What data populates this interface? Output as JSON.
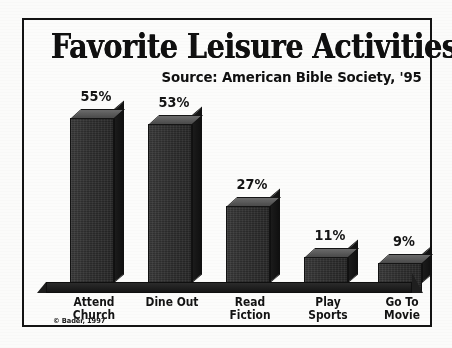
{
  "figure": {
    "title": "Favorite Leisure Activities",
    "subtitle": "Source: American Bible Society, '95",
    "copyright": "© Bader, 1997",
    "frame_color": "#131313",
    "background_color": "#fcfcfb",
    "bar_face_color": "#2f2f2f",
    "bar_top_color": "#5a5a5a",
    "bar_side_color": "#151515",
    "ground_color": "#1c1c1c",
    "text_color": "#131313"
  },
  "chart_data": {
    "type": "bar",
    "title": "Favorite Leisure Activities",
    "subtitle": "Source: American Bible Society, '95",
    "xlabel": "",
    "ylabel": "",
    "ylim": [
      0,
      60
    ],
    "grid": false,
    "legend": false,
    "units": "percent",
    "categories": [
      "Attend Church",
      "Dine Out",
      "Read Fiction",
      "Play Sports",
      "Go To Movie"
    ],
    "category_lines": [
      [
        "Attend",
        "Church"
      ],
      [
        "Dine Out",
        ""
      ],
      [
        "Read",
        "Fiction"
      ],
      [
        "Play",
        "Sports"
      ],
      [
        "Go To",
        "Movie"
      ]
    ],
    "values": [
      55,
      53,
      27,
      11,
      9
    ],
    "data_labels": [
      "55%",
      "53%",
      "27%",
      "11%",
      "9%"
    ]
  }
}
